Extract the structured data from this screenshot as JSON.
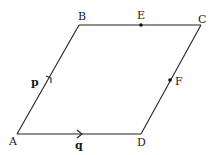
{
  "diagram": {
    "type": "parallelogram",
    "vertices": [
      {
        "name": "A",
        "label": "A",
        "x": 17,
        "y": 134,
        "lx": 9,
        "ly": 145
      },
      {
        "name": "B",
        "label": "B",
        "x": 79,
        "y": 25,
        "lx": 78,
        "ly": 20
      },
      {
        "name": "C",
        "label": "C",
        "x": 201,
        "y": 25,
        "lx": 198,
        "ly": 23
      },
      {
        "name": "D",
        "label": "D",
        "x": 141,
        "y": 134,
        "lx": 137,
        "ly": 146
      }
    ],
    "points": [
      {
        "name": "E",
        "label": "E",
        "x": 141,
        "y": 25,
        "lx": 137,
        "ly": 19,
        "on": "BC"
      },
      {
        "name": "F",
        "label": "F",
        "x": 170,
        "y": 80,
        "lx": 175,
        "ly": 85,
        "on": "CD"
      }
    ],
    "vectors": [
      {
        "name": "p",
        "label": "p",
        "from": "A",
        "to": "B",
        "lx": 31,
        "ly": 86
      },
      {
        "name": "q",
        "label": "q",
        "from": "A",
        "to": "D",
        "lx": 75,
        "ly": 149
      }
    ]
  }
}
